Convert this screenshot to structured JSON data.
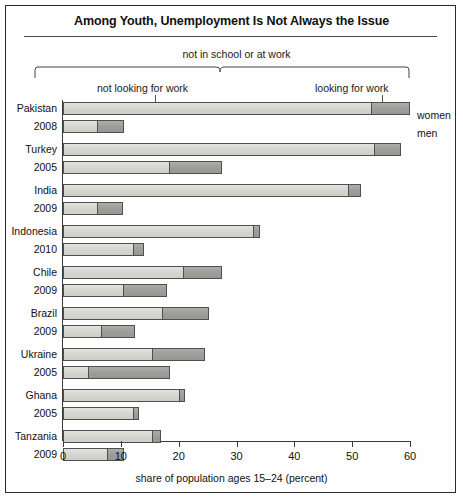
{
  "figure": {
    "title": "Among Youth, Unemployment Is Not Always the Issue",
    "bracket_label": "not in school or at work",
    "segment_label_left": "not looking for work",
    "segment_label_right": "looking for work",
    "legend_women": "women",
    "legend_men": "men",
    "x_axis_title": "share of population ages 15–24 (percent)"
  },
  "chart_data": {
    "type": "bar",
    "orientation": "horizontal",
    "stacked": true,
    "title": "Among Youth, Unemployment Is Not Always the Issue",
    "xlabel": "share of population ages 15–24 (percent)",
    "ylabel": "",
    "xlim": [
      0,
      60
    ],
    "xticks": [
      0,
      10,
      20,
      30,
      40,
      50,
      60
    ],
    "grid": false,
    "legend_position": "right",
    "series": [
      {
        "name": "not looking for work",
        "color": "#d6d6d1"
      },
      {
        "name": "looking for work",
        "color": "#9d9d99"
      }
    ],
    "groups": [
      {
        "country": "Pakistan",
        "year": "2008",
        "rows": [
          {
            "sex": "women",
            "not_looking": 53.5,
            "looking": 6.5,
            "total": 60.0
          },
          {
            "sex": "men",
            "not_looking": 6.0,
            "looking": 4.5,
            "total": 10.5
          }
        ]
      },
      {
        "country": "Turkey",
        "year": "2005",
        "rows": [
          {
            "sex": "women",
            "not_looking": 54.0,
            "looking": 4.5,
            "total": 58.5
          },
          {
            "sex": "men",
            "not_looking": 18.5,
            "looking": 9.0,
            "total": 27.5
          }
        ]
      },
      {
        "country": "India",
        "year": "2009",
        "rows": [
          {
            "sex": "women",
            "not_looking": 49.5,
            "looking": 2.0,
            "total": 51.5
          },
          {
            "sex": "men",
            "not_looking": 6.0,
            "looking": 4.4,
            "total": 10.4
          }
        ]
      },
      {
        "country": "Indonesia",
        "year": "2010",
        "rows": [
          {
            "sex": "women",
            "not_looking": 33.0,
            "looking": 1.0,
            "total": 34.0
          },
          {
            "sex": "men",
            "not_looking": 12.3,
            "looking": 1.7,
            "total": 14.0
          }
        ]
      },
      {
        "country": "Chile",
        "year": "2009",
        "rows": [
          {
            "sex": "women",
            "not_looking": 21.0,
            "looking": 6.5,
            "total": 27.5
          },
          {
            "sex": "men",
            "not_looking": 10.5,
            "looking": 7.5,
            "total": 18.0
          }
        ]
      },
      {
        "country": "Brazil",
        "year": "2009",
        "rows": [
          {
            "sex": "women",
            "not_looking": 17.3,
            "looking": 8.0,
            "total": 25.3
          },
          {
            "sex": "men",
            "not_looking": 6.7,
            "looking": 5.8,
            "total": 12.5
          }
        ]
      },
      {
        "country": "Ukraine",
        "year": "2005",
        "rows": [
          {
            "sex": "women",
            "not_looking": 15.5,
            "looking": 9.0,
            "total": 24.5
          },
          {
            "sex": "men",
            "not_looking": 4.5,
            "looking": 14.0,
            "total": 18.5
          }
        ]
      },
      {
        "country": "Ghana",
        "year": "2005",
        "rows": [
          {
            "sex": "women",
            "not_looking": 20.3,
            "looking": 0.8,
            "total": 21.1
          },
          {
            "sex": "men",
            "not_looking": 12.3,
            "looking": 0.9,
            "total": 13.2
          }
        ]
      },
      {
        "country": "Tanzania",
        "year": "2009",
        "rows": [
          {
            "sex": "women",
            "not_looking": 15.5,
            "looking": 1.5,
            "total": 17.0
          },
          {
            "sex": "men",
            "not_looking": 7.8,
            "looking": 2.7,
            "total": 10.5
          }
        ]
      }
    ]
  }
}
